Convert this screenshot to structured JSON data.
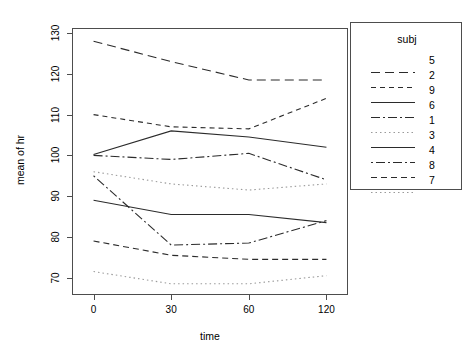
{
  "chart_data": {
    "type": "line",
    "title": "",
    "xlabel": "time",
    "ylabel": "mean of  hr",
    "categories": [
      "0",
      "30",
      "60",
      "120"
    ],
    "x_positions": [
      0,
      1,
      2,
      3
    ],
    "ylim": [
      66,
      131
    ],
    "yticks": [
      70,
      80,
      90,
      100,
      110,
      120,
      130
    ],
    "ytick_labels": [
      "70",
      "80",
      "90",
      "100",
      "110",
      "120",
      "130"
    ],
    "grid": false,
    "legend": {
      "title": "subj",
      "position": "right-outside",
      "entries": [
        "5",
        "2",
        "9",
        "6",
        "1",
        "3",
        "4",
        "8",
        "7"
      ]
    },
    "series": [
      {
        "name": "5",
        "linestyle": "dashed",
        "dash": "9,5",
        "color": "#2b2b2b",
        "values": [
          128.0,
          123.0,
          118.5,
          118.5
        ]
      },
      {
        "name": "2",
        "linestyle": "dashed",
        "dash": "5,4",
        "color": "#2b2b2b",
        "values": [
          110.0,
          107.0,
          106.5,
          114.0
        ]
      },
      {
        "name": "9",
        "linestyle": "solid",
        "dash": "0",
        "color": "#2b2b2b",
        "values": [
          100.2,
          106.0,
          104.5,
          102.0
        ]
      },
      {
        "name": "6",
        "linestyle": "dashdot",
        "dash": "9,3,2,3",
        "color": "#2b2b2b",
        "values": [
          100.0,
          99.0,
          100.5,
          94.0
        ]
      },
      {
        "name": "1",
        "linestyle": "dotted",
        "dash": "1.5,3",
        "color": "#9a9a9a",
        "values": [
          96.0,
          93.0,
          91.5,
          93.0
        ]
      },
      {
        "name": "3",
        "linestyle": "solid",
        "dash": "0",
        "color": "#2b2b2b",
        "values": [
          89.0,
          85.5,
          85.5,
          83.5
        ]
      },
      {
        "name": "4",
        "linestyle": "dashdot",
        "dash": "2,3,9,3",
        "color": "#2b2b2b",
        "values": [
          95.0,
          78.0,
          78.5,
          84.0
        ]
      },
      {
        "name": "8",
        "linestyle": "dashed",
        "dash": "6,4",
        "color": "#2b2b2b",
        "values": [
          79.0,
          75.5,
          74.5,
          74.5
        ]
      },
      {
        "name": "7",
        "linestyle": "dotted",
        "dash": "1.5,3",
        "color": "#9a9a9a",
        "values": [
          71.5,
          68.5,
          68.5,
          70.5
        ]
      }
    ]
  }
}
